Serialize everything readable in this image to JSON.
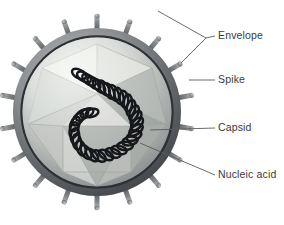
{
  "figure": {
    "type": "labeled-biological-diagram",
    "background_color": "#ffffff",
    "palette": {
      "envelope_dark": "#3f4145",
      "envelope_mid": "#6d7175",
      "envelope_light": "#a9adb0",
      "capsid_light": "#d8dad7",
      "capsid_mid": "#b0b4b2",
      "capsid_dark": "#7e8280",
      "interior_glow": "#e2e4e1",
      "spike_body": "#7a7d80",
      "spike_highlight": "#b6b9bb",
      "nucleic_acid": "#16181a",
      "leader_line": "#5a5a5a",
      "label_text": "#3a3a3a"
    },
    "virus": {
      "center_x": 97,
      "center_y": 112,
      "outer_radius": 88,
      "envelope_ring_thickness": 9,
      "spike_count": 18,
      "spike_length": 14,
      "spike_width": 5,
      "capsid_shape": "icosahedron",
      "capsid_radius": 62,
      "nucleic_acid_shape": "coiled helix, S-curve",
      "nucleic_acid_coil_count": 34
    }
  },
  "labels": [
    {
      "id": "envelope",
      "text": "Envelope",
      "leader_type": "bracket",
      "x": 218,
      "y": 30
    },
    {
      "id": "spike",
      "text": "Spike",
      "leader_type": "line",
      "x": 218,
      "y": 74
    },
    {
      "id": "capsid",
      "text": "Capsid",
      "leader_type": "line",
      "x": 218,
      "y": 122
    },
    {
      "id": "nucleic_acid",
      "text": "Nucleic acid",
      "leader_type": "line",
      "x": 218,
      "y": 169
    }
  ]
}
